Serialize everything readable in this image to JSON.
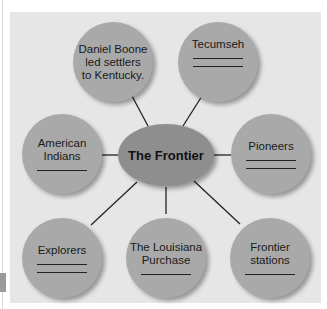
{
  "diagram": {
    "center": {
      "label": "The Frontier"
    },
    "nodes": [
      {
        "id": "daniel-boone",
        "lines": [
          "Daniel Boone",
          "led settlers",
          "to Kentucky."
        ],
        "blanks": 0
      },
      {
        "id": "tecumseh",
        "lines": [
          "Tecumseh"
        ],
        "blanks": 2
      },
      {
        "id": "american-indians",
        "lines": [
          "American",
          "Indians"
        ],
        "blanks": 1
      },
      {
        "id": "pioneers",
        "lines": [
          "Pioneers"
        ],
        "blanks": 2
      },
      {
        "id": "explorers",
        "lines": [
          "Explorers"
        ],
        "blanks": 2
      },
      {
        "id": "louisiana-purchase",
        "lines": [
          "The Louisiana",
          "Purchase"
        ],
        "blanks": 1
      },
      {
        "id": "frontier-stations",
        "lines": [
          "Frontier",
          "stations"
        ],
        "blanks": 1
      }
    ]
  },
  "colors": {
    "panel": "#e6e6e6",
    "node": "#a9a9a9",
    "center": "#8e8e8e",
    "line": "#222222"
  }
}
